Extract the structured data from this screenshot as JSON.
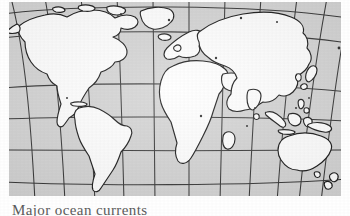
{
  "figure": {
    "kind": "world-map-illustration",
    "projection": "pseudocylindrical-globe-graticule",
    "background_color": "#d4d4d4",
    "land_fill_color": "#ffffff",
    "outline_color": "#1a1a1a",
    "graticule_color": "#3a3a3a",
    "page_color": "#ffffff"
  },
  "caption": {
    "text": "Major ocean currents",
    "visible_fragment": "M"
  },
  "graticule": {
    "parallels_count": 6,
    "meridians_count": 13,
    "parallel_labels": [
      "60N",
      "45N",
      "30N",
      "0",
      "30S",
      "45S"
    ],
    "meridian_labels": [
      "150W",
      "120W",
      "90W",
      "60W",
      "30W",
      "0",
      "30E",
      "60E",
      "90E",
      "120E",
      "150E",
      "180"
    ]
  },
  "landmasses": [
    {
      "name": "north-america"
    },
    {
      "name": "south-america"
    },
    {
      "name": "greenland"
    },
    {
      "name": "africa"
    },
    {
      "name": "europe"
    },
    {
      "name": "asia"
    },
    {
      "name": "australia"
    },
    {
      "name": "new-guinea"
    },
    {
      "name": "indonesia"
    },
    {
      "name": "japan"
    },
    {
      "name": "madagascar"
    },
    {
      "name": "new-zealand"
    },
    {
      "name": "british-isles"
    },
    {
      "name": "iceland"
    },
    {
      "name": "philippines"
    },
    {
      "name": "sri-lanka"
    },
    {
      "name": "caribbean-islands"
    }
  ]
}
